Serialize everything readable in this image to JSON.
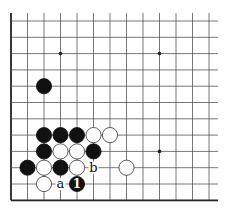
{
  "diagram": {
    "type": "go-board-corner",
    "grid": {
      "columns": 13,
      "rows": 12,
      "origin_x": 11,
      "origin_y": 21,
      "spacing_x": 16.5,
      "spacing_y": 16.3,
      "top_extend_y": 13,
      "right_extend_x": 218,
      "left_edge": true,
      "bottom_edge": true
    },
    "colors": {
      "line": "#555555",
      "edge": "#222222",
      "black_stone": "#111111",
      "white_stone": "#ffffff",
      "white_stone_border": "#333333"
    },
    "hoshi": [
      {
        "col": 3,
        "row": 2
      },
      {
        "col": 9,
        "row": 2
      },
      {
        "col": 9,
        "row": 8
      }
    ],
    "stones": [
      {
        "color": "black",
        "col": 2,
        "row": 4
      },
      {
        "color": "black",
        "col": 2,
        "row": 7
      },
      {
        "color": "black",
        "col": 3,
        "row": 7
      },
      {
        "color": "black",
        "col": 4,
        "row": 7
      },
      {
        "color": "white",
        "col": 5,
        "row": 7
      },
      {
        "color": "white",
        "col": 6,
        "row": 7
      },
      {
        "color": "black",
        "col": 2,
        "row": 8
      },
      {
        "color": "white",
        "col": 3,
        "row": 8
      },
      {
        "color": "white",
        "col": 4,
        "row": 8
      },
      {
        "color": "black",
        "col": 5,
        "row": 8
      },
      {
        "color": "black",
        "col": 1,
        "row": 9
      },
      {
        "color": "white",
        "col": 2,
        "row": 9
      },
      {
        "color": "black",
        "col": 3,
        "row": 9
      },
      {
        "color": "white",
        "col": 4,
        "row": 9
      },
      {
        "color": "white",
        "col": 7,
        "row": 9
      },
      {
        "color": "white",
        "col": 2,
        "row": 10
      },
      {
        "color": "black",
        "col": 4,
        "row": 10,
        "label": "1"
      }
    ],
    "labels": [
      {
        "text": "a",
        "col": 3,
        "row": 10
      },
      {
        "text": "b",
        "col": 5,
        "row": 9
      }
    ]
  }
}
